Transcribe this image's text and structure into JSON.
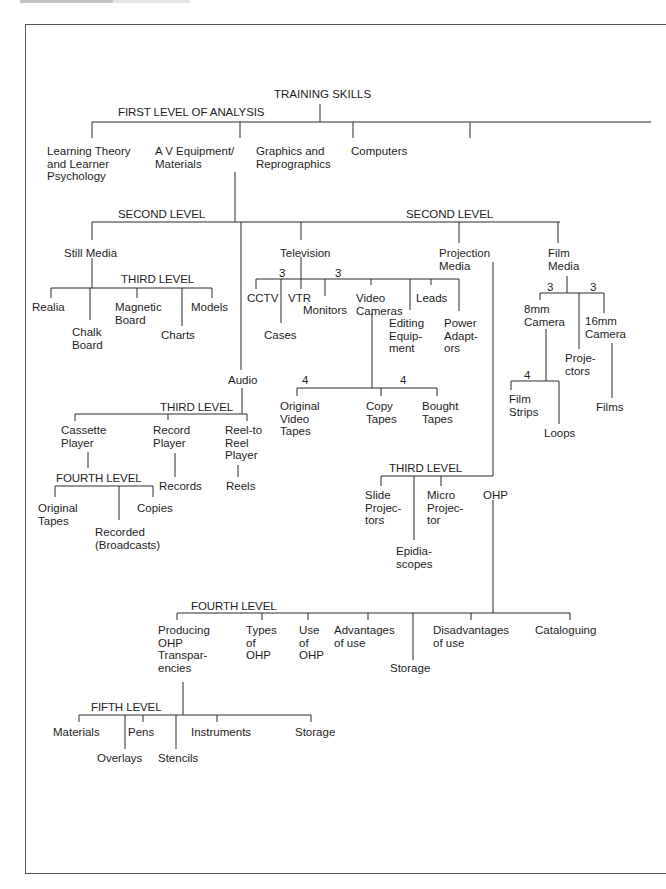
{
  "diagram": {
    "root": "TRAINING SKILLS",
    "level_labels": {
      "first": "FIRST LEVEL OF ANALYSIS",
      "second_left": "SECOND LEVEL",
      "second_right": "SECOND LEVEL",
      "third_still": "THIRD LEVEL",
      "third_audio": "THIRD LEVEL",
      "third_projection": "THIRD LEVEL",
      "fourth_audio": "FOURTH LEVEL",
      "fourth_ohp": "FOURTH LEVEL",
      "fifth": "FIFTH LEVEL"
    },
    "first_level": [
      "Learning Theory\nand Learner\nPsychology",
      "A V Equipment/\nMaterials",
      "Graphics and\nReprographics",
      "Computers"
    ],
    "second_level": [
      "Still Media",
      "Audio",
      "Television",
      "Projection\nMedia",
      "Film\nMedia"
    ],
    "still_media": [
      "Realia",
      "Chalk\nBoard",
      "Magnetic\nBoard",
      "Charts",
      "Models"
    ],
    "television": [
      "CCTV",
      "Cases",
      "VTR",
      "Monitors",
      "Video\nCameras",
      "Editing\nEquip-\nment",
      "Leads",
      "Power\nAdapt-\nors"
    ],
    "television_counts": [
      "3",
      "3"
    ],
    "video_cameras": [
      "Original\nVideo\nTapes",
      "Copy\nTapes",
      "Bought\nTapes"
    ],
    "video_counts": [
      "4",
      "4"
    ],
    "film_media": [
      "8mm\nCamera",
      "Proje-\nctors",
      "16mm\nCamera"
    ],
    "film_counts": [
      "3",
      "3"
    ],
    "camera_8mm": [
      "Film\nStrips",
      "Loops"
    ],
    "camera_8mm_count": "4",
    "camera_16mm": [
      "Films"
    ],
    "audio": [
      "Cassette\nPlayer",
      "Record\nPlayer",
      "Reel-to\nReel\nPlayer"
    ],
    "audio_sub": {
      "record": "Records",
      "reel": "Reels"
    },
    "cassette": [
      "Original\nTapes",
      "Recorded\n(Broadcasts)",
      "Copies"
    ],
    "projection": [
      "Slide\nProjec-\ntors",
      "Epidia-\nscopes",
      "Micro\nProjec-\ntor",
      "OHP"
    ],
    "ohp": [
      "Producing\nOHP\nTranspar-\nencies",
      "Types\nof\nOHP",
      "Use\nof\nOHP",
      "Advantages\nof use",
      "Storage",
      "Disadvantages\nof use",
      "Cataloguing"
    ],
    "transparencies": [
      "Materials",
      "Overlays",
      "Pens",
      "Stencils",
      "Instruments",
      "Storage"
    ]
  }
}
